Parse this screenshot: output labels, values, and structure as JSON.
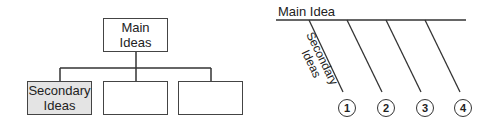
{
  "tree_diagram": {
    "root": {
      "line1": "Main",
      "line2": "Ideas"
    },
    "children": [
      {
        "line1": "Secondary",
        "line2": "Ideas",
        "filled": true
      },
      {
        "line1": "",
        "line2": ""
      },
      {
        "line1": "",
        "line2": ""
      }
    ]
  },
  "fishbone_diagram": {
    "main_label": "Main Idea",
    "branch_label": {
      "line1": "Secondary",
      "line2": "Ideas"
    },
    "branches": [
      "1",
      "2",
      "3",
      "4"
    ]
  },
  "colors": {
    "line": "#333333",
    "filled_box": "#e4e4e4",
    "background": "#ffffff"
  }
}
